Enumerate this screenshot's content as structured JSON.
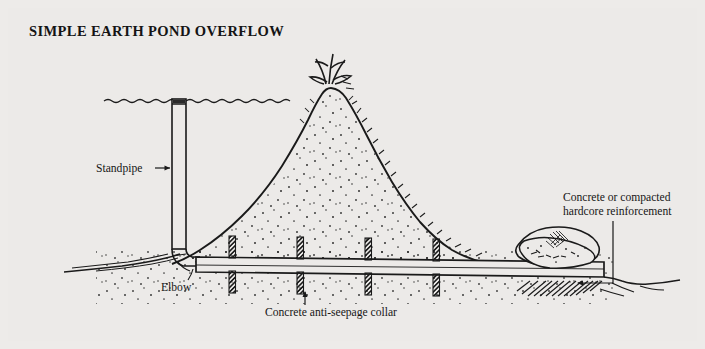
{
  "figure": {
    "title": "SIMPLE EARTH POND OVERFLOW",
    "background_color": "#eceae8",
    "ink_color": "#1a1a1a",
    "type": "cross-section technical illustration"
  },
  "labels": {
    "standpipe": "Standpipe",
    "elbow": "Elbow",
    "collar": "Concrete anti-seepage collar",
    "reinforcement_line1": "Concrete or compacted",
    "reinforcement_line2": "hardcore reinforcement"
  },
  "components": {
    "water_surface": "wavy-water-line",
    "embankment": "earth-dam-mound",
    "grass_tuft": "grass-tuft",
    "standpipe": "vertical-standpipe",
    "elbow": "pipe-elbow",
    "outlet_pipe": "horizontal-outlet-pipe",
    "collars": [
      "collar-1",
      "collar-2",
      "collar-3",
      "collar-4"
    ],
    "reinforcement": "hardcore-reinforcement-blob",
    "scour_hatching": "scour-protection-hatching",
    "pond_bed": "pond-bed-line",
    "downstream_ground": "downstream-ground-line"
  }
}
